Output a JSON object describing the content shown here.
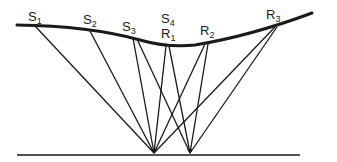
{
  "diagram": {
    "type": "seismic-reflection-ray-paths",
    "colors": {
      "line": "#1a1a1a",
      "background": "#ffffff"
    },
    "surface": {
      "path": "M17,25 Q90,26 140,40 Q168,48 195,45 Q250,36 312,13",
      "stroke_width": 3
    },
    "reflector": {
      "x1": 17,
      "y1": 155,
      "x2": 300,
      "y2": 155,
      "stroke_width": 1.5
    },
    "labels": [
      {
        "id": "S1",
        "main": "S",
        "sub": "1",
        "x": 28,
        "y": 21
      },
      {
        "id": "S2",
        "main": "S",
        "sub": "2",
        "x": 83,
        "y": 24
      },
      {
        "id": "S3",
        "main": "S",
        "sub": "3",
        "x": 122,
        "y": 31
      },
      {
        "id": "S4",
        "main": "S",
        "sub": "4",
        "x": 161,
        "y": 23
      },
      {
        "id": "R1",
        "main": "R",
        "sub": "1",
        "x": 161,
        "y": 38
      },
      {
        "id": "R2",
        "main": "R",
        "sub": "2",
        "x": 200,
        "y": 35
      },
      {
        "id": "R3",
        "main": "R",
        "sub": "3",
        "x": 266,
        "y": 19
      }
    ],
    "reflection_points": [
      {
        "id": "A",
        "x": 154,
        "y": 153
      },
      {
        "id": "B",
        "x": 190,
        "y": 153
      }
    ],
    "rays": [
      {
        "from": "S1",
        "x1": 35,
        "y1": 26,
        "x2": 154,
        "y2": 153
      },
      {
        "from": "S2",
        "x1": 90,
        "y1": 31,
        "x2": 154,
        "y2": 153
      },
      {
        "from": "S3",
        "x1": 133,
        "y1": 38,
        "x2": 154,
        "y2": 153
      },
      {
        "from": "S3",
        "x1": 137,
        "y1": 39,
        "x2": 190,
        "y2": 153
      },
      {
        "from": "R1",
        "x1": 166,
        "y1": 46,
        "x2": 154,
        "y2": 153
      },
      {
        "from": "R1",
        "x1": 169,
        "y1": 46,
        "x2": 190,
        "y2": 153
      },
      {
        "from": "R2",
        "x1": 205,
        "y1": 44,
        "x2": 154,
        "y2": 153
      },
      {
        "from": "R2",
        "x1": 208,
        "y1": 44,
        "x2": 190,
        "y2": 153
      },
      {
        "from": "R3",
        "x1": 275,
        "y1": 27,
        "x2": 154,
        "y2": 153
      },
      {
        "from": "R3",
        "x1": 277,
        "y1": 27,
        "x2": 190,
        "y2": 153
      }
    ]
  }
}
